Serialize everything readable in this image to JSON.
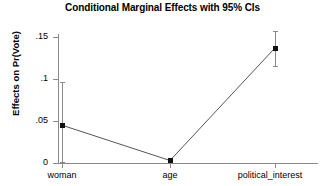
{
  "chart_data": {
    "type": "line",
    "title": "Conditional Marginal Effects with 95% CIs",
    "xlabel": "",
    "ylabel": "Effects on Pr(Vote)",
    "categories": [
      "woman",
      "age",
      "political_interest"
    ],
    "values": [
      0.045,
      0.003,
      0.137
    ],
    "ci_lower": [
      0.001,
      0.0,
      0.116
    ],
    "ci_upper": [
      0.096,
      0.006,
      0.157
    ],
    "series": [
      {
        "name": "Marginal effect",
        "values": [
          0.045,
          0.003,
          0.137
        ],
        "ci_lower": [
          0.001,
          0.0,
          0.116
        ],
        "ci_upper": [
          0.096,
          0.006,
          0.157
        ]
      }
    ],
    "ylim": [
      0,
      0.16
    ],
    "y_ticks": [
      0,
      0.05,
      0.1,
      0.15
    ],
    "y_tick_labels": [
      "0",
      ".05",
      ".1",
      ".15"
    ],
    "x_tick_labels": [
      "woman",
      "age",
      "political_interest"
    ],
    "grid": false,
    "legend": false,
    "confidence_level": "95%",
    "marker": "square",
    "line_color": "#555555",
    "marker_color": "#111111",
    "ci_color": "#8a8a8a",
    "axis_color": "#8a8a8a",
    "background_color": "#ffffff"
  },
  "axis": {
    "y_labels": [
      {
        "text": ".15"
      },
      {
        "text": ".1"
      },
      {
        "text": ".05"
      },
      {
        "text": "0"
      }
    ],
    "x_labels": [
      {
        "text": "woman"
      },
      {
        "text": "age"
      },
      {
        "text": "political_interest"
      }
    ],
    "y_title": "Effects on Pr(Vote)"
  }
}
